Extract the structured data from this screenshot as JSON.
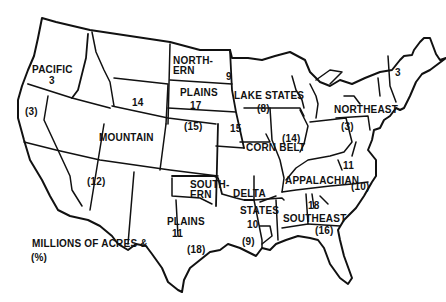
{
  "legend": {
    "line1": "MILLIONS OF ACRES &",
    "line2": "(%)"
  },
  "regions": [
    {
      "name": "PACIFIC",
      "acres": "3",
      "percent": "(3)"
    },
    {
      "name": "MOUNTAIN",
      "acres": "14",
      "percent": "(12)"
    },
    {
      "name_line1": "NORTH-",
      "name_line2": "ERN",
      "name_line3": "PLAINS",
      "acres": "17",
      "percent": "(15)"
    },
    {
      "name": "LAKE STATES",
      "acres": "9",
      "percent": "(8)"
    },
    {
      "name": "CORN BELT",
      "acres": "15",
      "percent": "(14)"
    },
    {
      "name": "NORTHEAST",
      "acres": "3",
      "percent": "(3)"
    },
    {
      "name": "APPALACHIAN",
      "acres": "11",
      "percent": "(10)"
    },
    {
      "name_line1": "SOUTH-",
      "name_line2": "ERN",
      "name_line3": "PLAINS",
      "acres": "11",
      "percent": "(18)"
    },
    {
      "name_line1": "DELTA",
      "name_line2": "STATES",
      "acres": "10",
      "percent": "(9)"
    },
    {
      "name": "SOUTHEAST",
      "acres": "18",
      "percent": "(16)"
    }
  ],
  "colors": {
    "ink": "#111111",
    "background": "#ffffff"
  }
}
